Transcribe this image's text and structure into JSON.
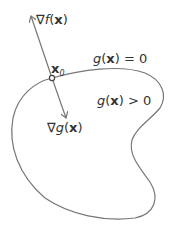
{
  "diagram": {
    "labels": {
      "grad_f": {
        "nabla": "∇",
        "fn": "f",
        "open": "(",
        "var": "x",
        "close": ")"
      },
      "grad_g": {
        "nabla": "∇",
        "fn": "g",
        "open": "(",
        "var": "x",
        "close": ")"
      },
      "point": {
        "var": "x",
        "sub": "0"
      },
      "boundary": {
        "fn": "g",
        "open": "(",
        "var": "x",
        "close": ")",
        "rel": " = 0"
      },
      "interior": {
        "fn": "g",
        "open": "(",
        "var": "x",
        "close": ")",
        "rel": " > 0"
      }
    },
    "colors": {
      "stroke": "#777777",
      "text": "#333333"
    }
  }
}
